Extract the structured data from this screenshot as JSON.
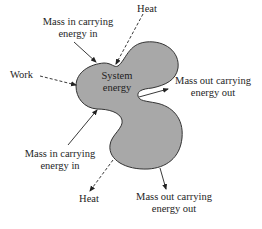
{
  "diagram": {
    "system_label": [
      "System",
      "energy"
    ],
    "fill_color": "#a8a8a8",
    "outline_color": "#333333",
    "labels": {
      "mass_in_top": [
        "Mass in carrying",
        "energy in"
      ],
      "heat_top": "Heat",
      "work": "Work",
      "mass_out_right": [
        "Mass out carrying",
        "energy out"
      ],
      "mass_in_bottom": [
        "Mass in carrying",
        "energy in"
      ],
      "heat_bottom": "Heat",
      "mass_out_bottom": [
        "Mass out carrying",
        "energy out"
      ]
    },
    "arrows": [
      {
        "name": "mass-in-top",
        "style": "solid",
        "direction": "in"
      },
      {
        "name": "heat-top",
        "style": "dashed",
        "direction": "in"
      },
      {
        "name": "work",
        "style": "dashed",
        "direction": "in"
      },
      {
        "name": "mass-out-right",
        "style": "solid",
        "direction": "out"
      },
      {
        "name": "mass-in-bottom",
        "style": "solid",
        "direction": "in"
      },
      {
        "name": "heat-bottom",
        "style": "dashed",
        "direction": "out"
      },
      {
        "name": "mass-out-bottom",
        "style": "solid",
        "direction": "out"
      }
    ]
  }
}
